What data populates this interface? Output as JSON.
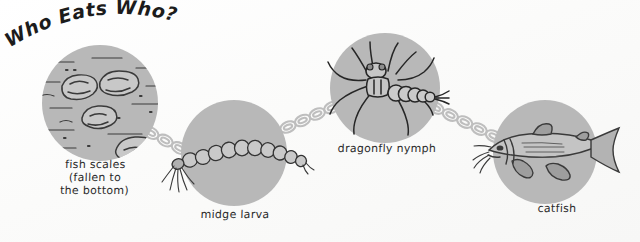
{
  "title": "Who Eats Who?",
  "background_color": "#fdfdfc",
  "circle_color": "#b8b8b8",
  "ink_color": "#2b2b2b",
  "chain_color": "#bcbcbc",
  "nodes": [
    {
      "id": "fish-scales",
      "label": "fish scales\n(fallen to\nthe bottom)",
      "subject": "fish scales",
      "order": 1
    },
    {
      "id": "midge-larva",
      "label": "midge larva",
      "subject": "midge larva",
      "order": 2
    },
    {
      "id": "dragonfly-nymph",
      "label": "dragonfly nymph",
      "subject": "dragonfly nymph",
      "order": 3
    },
    {
      "id": "catfish",
      "label": "catfish",
      "subject": "catfish",
      "order": 4
    }
  ],
  "connectors": [
    {
      "from": "fish-scales",
      "to": "midge-larva",
      "style": "chain"
    },
    {
      "from": "midge-larva",
      "to": "dragonfly-nymph",
      "style": "chain"
    },
    {
      "from": "dragonfly-nymph",
      "to": "catfish",
      "style": "chain"
    }
  ]
}
